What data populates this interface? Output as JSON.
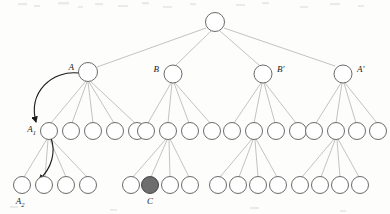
{
  "figure": {
    "kind": "tree-diagram",
    "width": 390,
    "height": 214,
    "background_color": "#fdfdfc",
    "edge_color": "#9a9a9a",
    "node_stroke_color": "#5a5a5a",
    "node_fill_color": "#ffffff",
    "highlight_fill_color": "#6e6e6e",
    "pointer_color": "#1a1a1a"
  },
  "labels": {
    "A": "A",
    "B": "B",
    "B_prime": "B′",
    "A_prime": "A′",
    "A1_base": "A",
    "A1_sub": "1",
    "A2_base": "A",
    "A2_sub": "2",
    "C": "C"
  },
  "tree": {
    "root": {
      "id": "root",
      "cx": 215,
      "cy": 22,
      "r": 9.5,
      "label": ""
    },
    "level1": [
      {
        "id": "A",
        "cx": 88,
        "cy": 72,
        "r": 9.5,
        "label": "A",
        "label_x": 74,
        "label_y": 70,
        "label_anchor": "end"
      },
      {
        "id": "B",
        "cx": 173,
        "cy": 74,
        "r": 9.0,
        "label": "B",
        "label_x": 159,
        "label_y": 72,
        "label_anchor": "end"
      },
      {
        "id": "Bp",
        "cx": 263,
        "cy": 74,
        "r": 9.0,
        "label": "B′",
        "label_x": 277,
        "label_y": 72,
        "label_anchor": "start"
      },
      {
        "id": "Ap",
        "cx": 343,
        "cy": 74,
        "r": 9.0,
        "label": "A′",
        "label_x": 357,
        "label_y": 72,
        "label_anchor": "start"
      }
    ],
    "level2_groups": [
      {
        "parent": "A",
        "nodes_cx": [
          49,
          71,
          93,
          115,
          137
        ],
        "cy": 131,
        "r": 8.5,
        "marked_index": 0,
        "marked_label": "A1"
      },
      {
        "parent": "B",
        "nodes_cx": [
          146,
          168,
          190,
          212
        ],
        "cy": 131,
        "r": 8.5,
        "marked_index": -1,
        "marked_label": ""
      },
      {
        "parent": "Bp",
        "nodes_cx": [
          232,
          254,
          276,
          298
        ],
        "cy": 131,
        "r": 8.5,
        "marked_index": -1,
        "marked_label": ""
      },
      {
        "parent": "Ap",
        "nodes_cx": [
          314,
          336,
          357,
          378
        ],
        "cy": 131,
        "r": 8.5,
        "marked_index": -1,
        "marked_label": ""
      }
    ],
    "level3_groups": [
      {
        "parent_cx": 49,
        "parent_cy": 131,
        "nodes_cx": [
          22,
          44,
          66,
          88
        ],
        "cy": 185,
        "r": 8.5,
        "filled_index": -1,
        "arrow_target_index": 1,
        "label": "A2",
        "label_x": 20,
        "label_y": 203
      },
      {
        "parent_cx": 168,
        "parent_cy": 131,
        "nodes_cx": [
          131,
          150,
          170,
          190
        ],
        "cy": 185,
        "r": 8.5,
        "filled_index": 1,
        "arrow_target_index": -1,
        "label": "C",
        "label_x": 150,
        "label_y": 203
      },
      {
        "parent_cx": 254,
        "parent_cy": 131,
        "nodes_cx": [
          218,
          238,
          258,
          278
        ],
        "cy": 185,
        "r": 8.5,
        "filled_index": -1,
        "arrow_target_index": -1,
        "label": "",
        "label_x": 0,
        "label_y": 0
      },
      {
        "parent_cx": 336,
        "parent_cy": 131,
        "nodes_cx": [
          300,
          320,
          340,
          360
        ],
        "cy": 185,
        "r": 8.5,
        "filled_index": -1,
        "arrow_target_index": -1,
        "label": "",
        "label_x": 0,
        "label_y": 0
      }
    ]
  },
  "pointers": [
    {
      "id": "A-to-A1",
      "from": "A",
      "to": "A1",
      "description": "curved arrow from node A down-left to node A1"
    },
    {
      "id": "A1-to-A2",
      "from": "A1",
      "to": "A2",
      "description": "curved arrow from node A1 down-left to node A2"
    }
  ]
}
